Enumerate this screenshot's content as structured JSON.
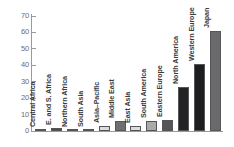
{
  "chart_data": {
    "type": "bar",
    "title": "",
    "subtitle": "",
    "xlabel": "",
    "ylabel": "",
    "ylim": [
      0,
      70
    ],
    "ytick_step": 10,
    "yticks": [
      "70",
      "60",
      "50",
      "40",
      "30",
      "20",
      "10",
      "0"
    ],
    "grid": false,
    "legend": "none",
    "categories": [
      "Central Africa",
      "E. and S. Africa",
      "Northern Africa",
      "South Asia",
      "Asia–Pacific",
      "Middle East",
      "East Asia",
      "South America",
      "Eastern Europe",
      "North America",
      "Western Europe",
      "Japan"
    ],
    "values": [
      0.5,
      2.0,
      0.5,
      0.3,
      3.0,
      6.0,
      3.0,
      6.0,
      6.5,
      27.0,
      40.5,
      61.0
    ],
    "bar_colors": [
      "#4a4a4a",
      "#4a4a4a",
      "#b8b8b8",
      "#b8b8b8",
      "#dcdcdc",
      "#6e6e6e",
      "#dcdcdc",
      "#aaaaaa",
      "#555555",
      "#232323",
      "#1d1d1d",
      "#6a6a6a"
    ],
    "axis_color": "#9a9a9a",
    "tick_label_color": "#6d6d6d",
    "bar_label_color": "#3b3b3b",
    "background": "#ffffff"
  }
}
